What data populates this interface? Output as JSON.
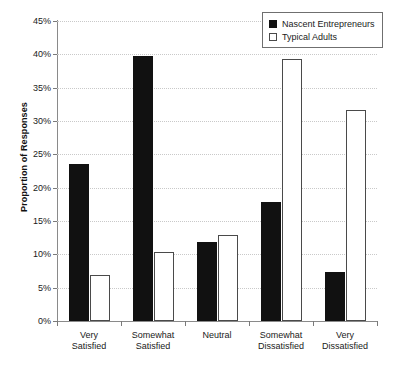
{
  "chart_data": {
    "type": "bar",
    "title": "",
    "xlabel": "",
    "ylabel": "Proportion of Responses",
    "ylim": [
      0,
      45
    ],
    "ytick_step": 5,
    "ytick_labels": [
      "0%",
      "5%",
      "10%",
      "15%",
      "20%",
      "25%",
      "30%",
      "35%",
      "40%",
      "45%"
    ],
    "ytick_values": [
      0,
      5,
      10,
      15,
      20,
      25,
      30,
      35,
      40,
      45
    ],
    "grid": true,
    "grid_style": "dotted horizontal",
    "legend_position": "top-right",
    "categories": [
      "Very Satisfied",
      "Somewhat Satisfied",
      "Neutral",
      "Somewhat Dissatisfied",
      "Very Dissatisfied"
    ],
    "category_lines": [
      [
        "Very",
        "Satisfied"
      ],
      [
        "Somewhat",
        "Satisfied"
      ],
      [
        "Neutral",
        ""
      ],
      [
        "Somewhat",
        "Dissatisfied"
      ],
      [
        "Very",
        "Dissatisfied"
      ]
    ],
    "series": [
      {
        "name": "Nascent Entrepreneurs",
        "style": "filled",
        "color": "#111111",
        "values": [
          23.6,
          39.7,
          11.8,
          17.8,
          7.3
        ]
      },
      {
        "name": "Typical Adults",
        "style": "open",
        "color": "#ffffff",
        "values": [
          6.9,
          10.3,
          12.9,
          39.3,
          31.7
        ]
      }
    ]
  },
  "legend": {
    "items": [
      {
        "label": "Nascent Entrepreneurs",
        "swatch": "filled-square-icon"
      },
      {
        "label": "Typical Adults",
        "swatch": "open-square-icon"
      }
    ]
  },
  "axis": {
    "y_title": "Proportion of Responses"
  }
}
